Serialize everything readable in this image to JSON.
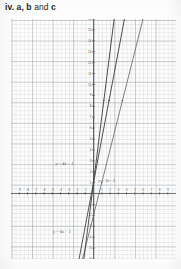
{
  "caption": {
    "number": "iv.",
    "a": "a",
    "comma": ",",
    "b": "b",
    "and": "and",
    "c": "c"
  },
  "chart_data": {
    "type": "line",
    "title": "",
    "xlabel": "",
    "ylabel": "",
    "xlim": [
      -10,
      10
    ],
    "ylim": [
      -6,
      16
    ],
    "grid": true,
    "grid_minor_step": 1,
    "grid_major_step": 5,
    "legend": "inline-labels",
    "x_ticks": [
      "-9",
      "-8",
      "-7",
      "-6",
      "-5",
      "-4",
      "-3",
      "-2",
      "-1",
      "1",
      "2",
      "3",
      "4",
      "5",
      "6",
      "7",
      "8",
      "9"
    ],
    "y_ticks": [
      "16",
      "15",
      "14",
      "13",
      "12",
      "11",
      "10",
      "9",
      "8",
      "7",
      "6",
      "5",
      "4",
      "3",
      "2",
      "1",
      "-1",
      "-2",
      "-3",
      "-4",
      "-5",
      "-6"
    ],
    "series": [
      {
        "name": "a",
        "label": "y = 4x + 1",
        "slope": 4,
        "intercept": 1,
        "color": "#2b2724",
        "label_x": -4.6,
        "label_y": 2.6
      },
      {
        "name": "b",
        "label": "y = 3x - 2",
        "slope": 3,
        "intercept": -2,
        "color": "#2b2724",
        "label_x": 0.6,
        "label_y": 1.1
      },
      {
        "name": "c",
        "label": "y = 6x + 1",
        "slope": 6,
        "intercept": 1,
        "color": "#2b2724",
        "label_x": -4.9,
        "label_y": -3.6
      }
    ]
  }
}
